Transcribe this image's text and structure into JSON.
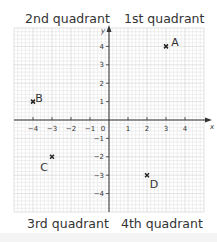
{
  "quadrants": {
    "q1": "1st quadrant",
    "q2": "2nd quadrant",
    "q3": "3rd quadrant",
    "q4": "4th quadrant"
  },
  "axes": {
    "x_label": "x",
    "y_label": "y",
    "origin_label": "0",
    "x_ticks": [
      -4,
      -3,
      -2,
      -1,
      1,
      2,
      3,
      4
    ],
    "y_ticks": [
      4,
      3,
      2,
      1,
      -1,
      -2,
      -3,
      -4
    ]
  },
  "points": [
    {
      "label": "A",
      "x": 3,
      "y": 4,
      "label_dx": 5,
      "label_dy": -4
    },
    {
      "label": "B",
      "x": -4,
      "y": 1,
      "label_dx": 2,
      "label_dy": -4
    },
    {
      "label": "C",
      "x": -3,
      "y": -2,
      "label_dx": -12,
      "label_dy": 10
    },
    {
      "label": "D",
      "x": 2,
      "y": -3,
      "label_dx": 3,
      "label_dy": 9
    }
  ],
  "colors": {
    "grid_minor": "#e4e4e4",
    "grid_major": "#cfcfcf",
    "axis": "#333333",
    "text": "#333333",
    "marker": "#222222"
  }
}
